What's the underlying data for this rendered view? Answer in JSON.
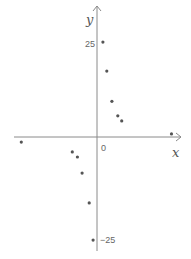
{
  "chart_data": {
    "type": "scatter",
    "title": "",
    "xlabel": "x",
    "ylabel": "y",
    "origin_label": "0",
    "y_ticks": [
      25,
      -25
    ],
    "y_tick_labels": [
      "25",
      "-25"
    ],
    "ylim": [
      -28,
      33
    ],
    "xlim": [
      -21,
      21
    ],
    "grid": false,
    "legend": null,
    "colors": {
      "axis": "#888888",
      "point": "#555555"
    },
    "points": [
      {
        "x": 1.5,
        "y": 24.2
      },
      {
        "x": 2.5,
        "y": 16.8
      },
      {
        "x": 3.8,
        "y": 9.1
      },
      {
        "x": 5.3,
        "y": 5.4
      },
      {
        "x": 6.3,
        "y": 4.1
      },
      {
        "x": 19.0,
        "y": 0.8
      },
      {
        "x": -19.3,
        "y": -1.3
      },
      {
        "x": -6.3,
        "y": -3.8
      },
      {
        "x": -5.0,
        "y": -5.1
      },
      {
        "x": -3.8,
        "y": -9.2
      },
      {
        "x": -2.0,
        "y": -16.8
      },
      {
        "x": -1.0,
        "y": -26.3
      }
    ]
  },
  "axes": {
    "x_label": "x",
    "y_label": "y",
    "origin": "0",
    "tick_pos": "25",
    "tick_neg": "−25"
  }
}
